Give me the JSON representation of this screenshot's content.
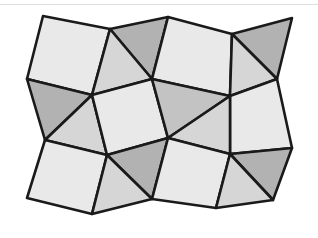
{
  "figure": {
    "title": "Tessellation of squares and triangles",
    "canvas": {
      "width": 318,
      "height": 238,
      "background": "#ffffff"
    },
    "style": {
      "stroke_color": "#1a1a1a",
      "stroke_width": 2.6,
      "square_fill": "#e9e9e9",
      "triangle_fill_light": "#d6d6d6",
      "triangle_fill_dark": "#b2b2b2",
      "triangle_fill_mid": "#c3c3c3"
    },
    "artifact": {
      "name": "scan-line",
      "y": 4,
      "color": "#d8d8d8"
    },
    "counts": {
      "squares": 9,
      "triangles": 10,
      "total_tiles": 19
    },
    "vertices": {
      "v_tl": [
        43,
        16
      ],
      "v_a": [
        110,
        29
      ],
      "v_peak1": [
        168,
        17
      ],
      "v_b": [
        232,
        34
      ],
      "v_peak2": [
        292,
        18
      ],
      "v_left_up": [
        27,
        79
      ],
      "v_c": [
        91,
        94
      ],
      "v_d": [
        152,
        79
      ],
      "v_e": [
        230,
        96
      ],
      "v_right_up": [
        277,
        79
      ],
      "v_left_mid": [
        45,
        140
      ],
      "v_f": [
        107,
        155
      ],
      "v_center": [
        168,
        138
      ],
      "v_g": [
        230,
        154
      ],
      "v_right_mid": [
        292,
        148
      ],
      "v_left_low": [
        27,
        198
      ],
      "v_h": [
        92,
        214
      ],
      "v_i": [
        152,
        199
      ],
      "v_j": [
        216,
        208
      ],
      "v_right_low": [
        273,
        200
      ]
    },
    "tiles": [
      {
        "name": "square-top-left",
        "kind": "square",
        "shade": "light",
        "points": "43,16 110,29 92,95 27,79"
      },
      {
        "name": "triangle-top-left-dark",
        "kind": "triangle",
        "shade": "dark",
        "points": "110,29 168,17 152,79"
      },
      {
        "name": "triangle-top-left-inner",
        "kind": "triangle",
        "shade": "light-grey",
        "points": "110,29 152,79 92,95"
      },
      {
        "name": "square-top-center",
        "kind": "square",
        "shade": "light",
        "points": "168,17 232,34 230,96 152,79"
      },
      {
        "name": "triangle-top-right-dark",
        "kind": "triangle",
        "shade": "dark",
        "points": "232,34 292,18 277,79"
      },
      {
        "name": "triangle-top-right-inner",
        "kind": "triangle",
        "shade": "light-grey",
        "points": "232,34 277,79 230,96"
      },
      {
        "name": "triangle-left-upper-dark",
        "kind": "triangle",
        "shade": "dark",
        "points": "27,79 92,95 45,140"
      },
      {
        "name": "triangle-left-upper-light",
        "kind": "triangle",
        "shade": "light-grey",
        "points": "92,95 107,155 45,140"
      },
      {
        "name": "square-middle-left",
        "kind": "square",
        "shade": "light",
        "points": "92,95 152,79 168,138 107,155"
      },
      {
        "name": "triangle-center-mid",
        "kind": "triangle",
        "shade": "mid",
        "points": "152,79 230,96 168,138"
      },
      {
        "name": "square-middle-right",
        "kind": "square",
        "shade": "light",
        "points": "230,96 277,79 292,148 230,154"
      },
      {
        "name": "triangle-center-right",
        "kind": "triangle",
        "shade": "light-grey",
        "points": "230,96 230,154 168,138"
      },
      {
        "name": "square-bottom-left",
        "kind": "square",
        "shade": "light",
        "points": "45,140 107,155 92,214 27,198"
      },
      {
        "name": "triangle-bottom-left-dark",
        "kind": "triangle",
        "shade": "dark",
        "points": "107,155 168,138 152,199"
      },
      {
        "name": "triangle-bottom-left-light",
        "kind": "triangle",
        "shade": "light-grey",
        "points": "107,155 152,199 92,214"
      },
      {
        "name": "square-bottom-center",
        "kind": "square",
        "shade": "light",
        "points": "168,138 230,154 216,208 152,199"
      },
      {
        "name": "triangle-bottom-right-dark",
        "kind": "triangle",
        "shade": "dark",
        "points": "230,154 292,148 273,200"
      },
      {
        "name": "triangle-bottom-right-light",
        "kind": "triangle",
        "shade": "light-grey",
        "points": "230,154 273,200 216,208"
      }
    ]
  }
}
